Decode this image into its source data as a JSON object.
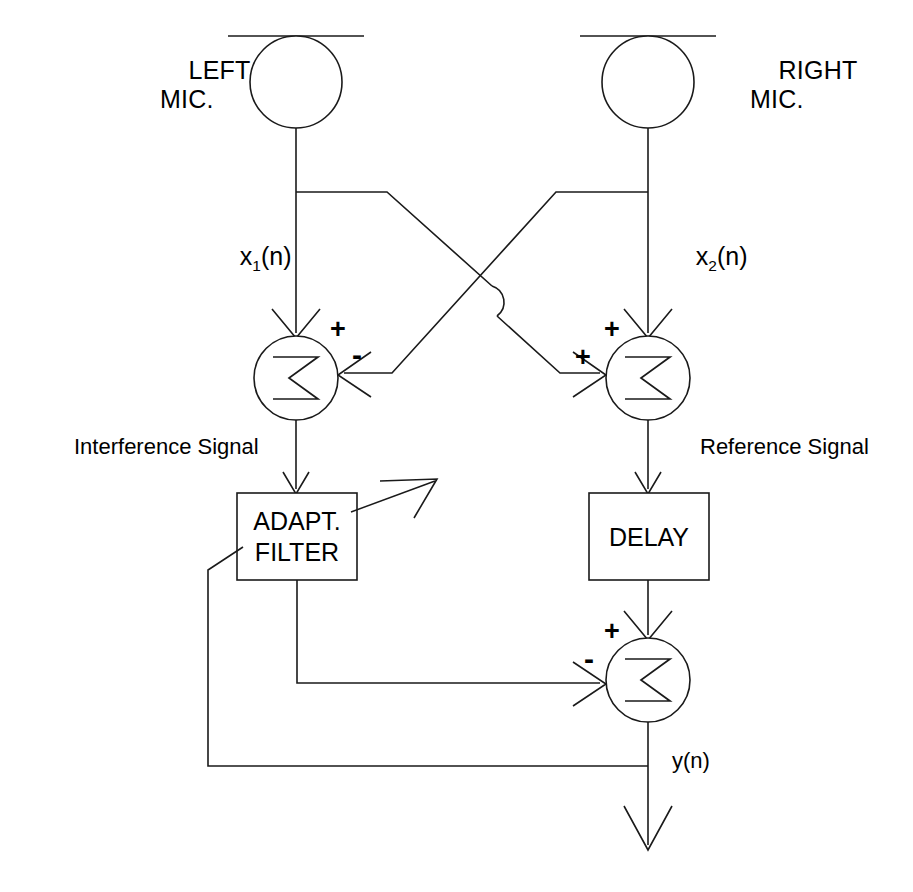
{
  "figure": {
    "kind": "signal-flow-block-diagram",
    "background_color": "#ffffff",
    "line_color": "#1a1a1a",
    "width": 913,
    "height": 892
  },
  "labels": {
    "left_mic": "LEFT\nMIC.",
    "right_mic": "RIGHT\nMIC.",
    "x1_base": "x",
    "x1_sub": "1",
    "x1_tail": "(n)",
    "x2_base": "x",
    "x2_sub": "2",
    "x2_tail": "(n)",
    "interference_signal": "Interference Signal",
    "reference_signal": "Reference Signal",
    "adaptive_filter": "ADAPT.\nFILTER",
    "delay": "DELAY",
    "output": "y(n)",
    "sigma": "Σ"
  },
  "signs": {
    "sum_left_top": "+",
    "sum_left_right": "-",
    "sum_right_top": "+",
    "sum_right_left": "+",
    "sum_out_top": "+",
    "sum_out_left": "-"
  },
  "nodes": {
    "mic_left": {
      "name": "left-microphone",
      "cx": 296,
      "cy": 82,
      "r": 46
    },
    "mic_right": {
      "name": "right-microphone",
      "cx": 648,
      "cy": 82,
      "r": 46
    },
    "sum_left": {
      "name": "left-summing-junction",
      "cx": 296,
      "cy": 378,
      "r": 42
    },
    "sum_right": {
      "name": "right-summing-junction",
      "cx": 648,
      "cy": 378,
      "r": 42
    },
    "sum_out": {
      "name": "output-summing-junction",
      "cx": 648,
      "cy": 680,
      "r": 42
    },
    "box_filter": {
      "name": "adaptive-filter-block",
      "x": 237,
      "y": 493,
      "w": 120,
      "h": 87
    },
    "box_delay": {
      "name": "delay-block",
      "x": 589,
      "y": 493,
      "w": 120,
      "h": 87
    }
  }
}
